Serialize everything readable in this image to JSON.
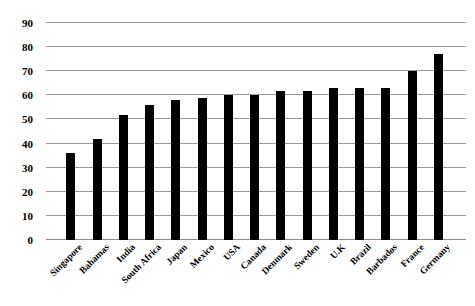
{
  "chart_data": {
    "type": "bar",
    "title": "",
    "subtitle": "",
    "xlabel": "",
    "ylabel": "",
    "ylim": [
      0,
      90
    ],
    "ytick_step": 10,
    "yticks": [
      "0",
      "10",
      "20",
      "30",
      "40",
      "50",
      "60",
      "70",
      "80",
      "90"
    ],
    "grid": true,
    "legend": false,
    "legend_position": "none",
    "bar_color": "#000000",
    "gridline_color": "#9a9a9a",
    "background_color": "#ffffff",
    "categories": [
      "Singapore",
      "Bahamas",
      "India",
      "South Africa",
      "Japan",
      "Mexico",
      "USA",
      "Canada",
      "Denmark",
      "Sweden",
      "U.K",
      "Brazil",
      "Barbados",
      "France",
      "Germany"
    ],
    "values": [
      36,
      42,
      52,
      56,
      58,
      59,
      60,
      60,
      62,
      62,
      63,
      63,
      63,
      70,
      77
    ]
  }
}
